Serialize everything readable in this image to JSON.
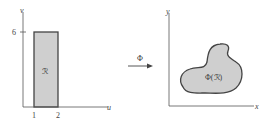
{
  "left_plot": {
    "x_axis_label": "u",
    "y_axis_label": "v",
    "x_ticks": [
      "1",
      "2"
    ],
    "y_ticks": [
      "6"
    ],
    "region_label": "ℛ",
    "region_fill": "#cfcfcf",
    "region_stroke": "#444444"
  },
  "mapping": {
    "label": "Φ",
    "arrow_icon": "right-arrow-icon"
  },
  "right_plot": {
    "x_axis_label": "x",
    "y_axis_label": "y",
    "region_label": "Φ(ℛ)",
    "region_fill": "#cfcfcf",
    "region_stroke": "#444444"
  }
}
